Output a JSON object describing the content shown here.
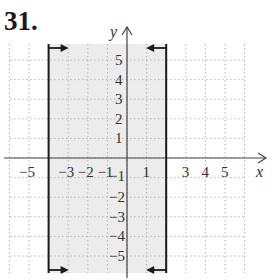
{
  "problem": {
    "number": "31."
  },
  "colors": {
    "shade": "#ececec",
    "grid": "#b5b5b5",
    "axis": "#444444",
    "boundary": "#1a1a1a"
  },
  "chart_data": {
    "type": "region",
    "title": "31.",
    "xlabel": "x",
    "ylabel": "y",
    "xlim": [
      -6,
      6
    ],
    "ylim": [
      -6,
      6
    ],
    "grid": true,
    "grid_style": "dotted",
    "x_tick_labels": [
      "-5",
      "-3",
      "-2",
      "-1",
      "1",
      "3",
      "4",
      "5"
    ],
    "y_tick_labels": [
      "5",
      "4",
      "3",
      "2",
      "1",
      "-1",
      "-2",
      "-3",
      "-4",
      "-5"
    ],
    "region": {
      "description": "Vertical strip between two solid vertical boundary lines",
      "x_min": -4,
      "x_max": 2,
      "inequality": "-4 <= x <= 2",
      "boundaries": [
        {
          "x": -4,
          "style": "solid",
          "arrows": "pointing right (inward) at top and bottom"
        },
        {
          "x": 2,
          "style": "solid",
          "arrows": "pointing left (inward) at top and bottom"
        }
      ],
      "shaded": true
    }
  }
}
